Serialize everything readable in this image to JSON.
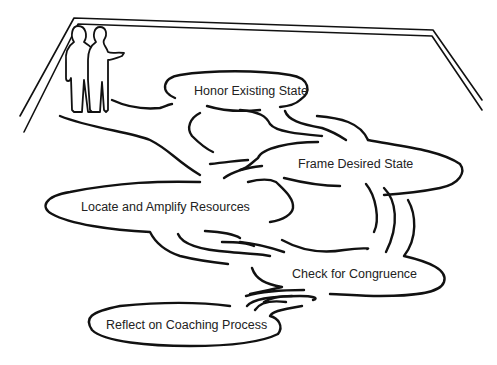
{
  "diagram": {
    "type": "coaching-process-landscape",
    "style": "hand-drawn line sketch",
    "colors": {
      "line": "#111111",
      "text": "#222222",
      "background": "#ffffff"
    },
    "scene": {
      "room_outline": "perspective floor with double-line back and side walls",
      "figures": "two standing people in the upper-left corner, one gesturing toward the path"
    },
    "stages": [
      {
        "id": "honor",
        "label": "Honor Existing State"
      },
      {
        "id": "frame",
        "label": "Frame Desired State"
      },
      {
        "id": "locate",
        "label": "Locate and Amplify Resources"
      },
      {
        "id": "check",
        "label": "Check for Congruence"
      },
      {
        "id": "reflect",
        "label": "Reflect on Coaching Process"
      }
    ],
    "flow": [
      "honor",
      "frame",
      "locate",
      "check",
      "reflect"
    ]
  }
}
